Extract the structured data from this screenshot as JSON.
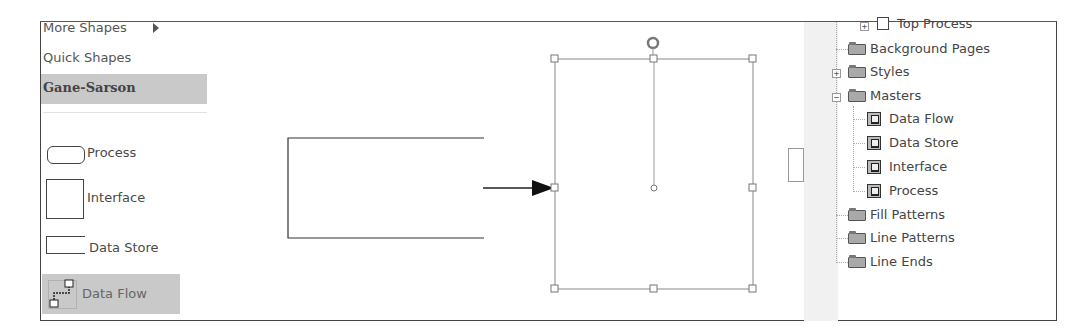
{
  "shapes_panel": {
    "more_shapes": "More Shapes",
    "quick_shapes": "Quick Shapes",
    "selected_stencil": "Gane-Sarson",
    "shapes": [
      {
        "name": "Process",
        "icon": "process-shape-icon"
      },
      {
        "name": "Interface",
        "icon": "interface-shape-icon"
      },
      {
        "name": "Data Store",
        "icon": "data-store-shape-icon"
      },
      {
        "name": "Data Flow",
        "icon": "data-flow-connector-icon",
        "selected": true
      }
    ]
  },
  "canvas": {
    "shapes": [
      {
        "type": "data-store-open-rect",
        "x": 287,
        "y": 138,
        "w": 196,
        "h": 100
      },
      {
        "type": "data-flow-arrow",
        "from": [
          483,
          187
        ],
        "to": [
          554,
          187
        ]
      },
      {
        "type": "selected-shape",
        "x": 554,
        "y": 58,
        "w": 198,
        "h": 230
      }
    ]
  },
  "drawing_explorer": {
    "items": [
      {
        "label": "Top Process",
        "level": 1,
        "icon": "page-icon",
        "expander": "+"
      },
      {
        "label": "Background Pages",
        "level": 0,
        "icon": "folder-icon"
      },
      {
        "label": "Styles",
        "level": 0,
        "icon": "folder-icon",
        "expander": "+"
      },
      {
        "label": "Masters",
        "level": 0,
        "icon": "folder-open-icon",
        "expander": "-"
      },
      {
        "label": "Data Flow",
        "level": 1,
        "icon": "master-icon"
      },
      {
        "label": "Data Store",
        "level": 1,
        "icon": "master-icon"
      },
      {
        "label": "Interface",
        "level": 1,
        "icon": "master-icon"
      },
      {
        "label": "Process",
        "level": 1,
        "icon": "master-icon"
      },
      {
        "label": "Fill Patterns",
        "level": 0,
        "icon": "folder-icon"
      },
      {
        "label": "Line Patterns",
        "level": 0,
        "icon": "folder-icon"
      },
      {
        "label": "Line Ends",
        "level": 0,
        "icon": "folder-icon"
      }
    ]
  },
  "colors": {
    "selection_highlight": "#c9c9c9",
    "border": "#444444",
    "text": "#4a4a4a"
  }
}
